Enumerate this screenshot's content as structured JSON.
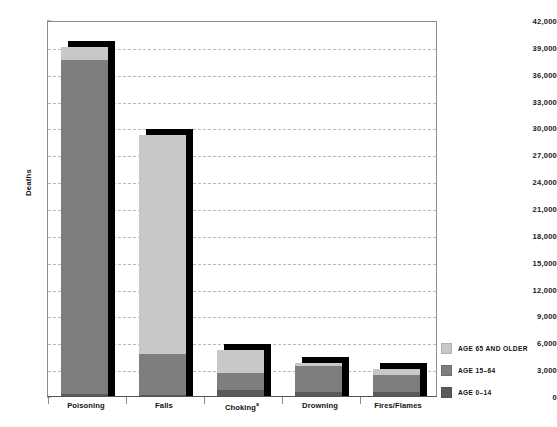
{
  "chart_data": {
    "type": "bar",
    "subtype": "stacked-bar-with-drop-shadow",
    "title": "",
    "xlabel": "",
    "ylabel": "Deaths",
    "ylim": [
      0,
      42000
    ],
    "ytick_step": 3000,
    "ytick_labels": [
      "42,000",
      "39,000",
      "36,000",
      "33,000",
      "30,000",
      "27,000",
      "24,000",
      "21,000",
      "18,000",
      "15,000",
      "12,000",
      "9,000",
      "6,000",
      "3,000",
      "0"
    ],
    "ytick_values": [
      42000,
      39000,
      36000,
      33000,
      30000,
      27000,
      24000,
      21000,
      18000,
      15000,
      12000,
      9000,
      6000,
      3000,
      0
    ],
    "grid": true,
    "grid_style": "dashed-horizontal",
    "legend_position": "right",
    "categories": [
      "Poisoning",
      "Falls",
      "Choking",
      "Drowning",
      "Fires/Flames"
    ],
    "category_labels": [
      "Poisoning",
      "Falls",
      "Chokingᵃ",
      "Drowning",
      "Fires/Flames"
    ],
    "footnote_marker": "a",
    "series": [
      {
        "name": "AGE 65 AND OLDER",
        "color": "#c8c8c8",
        "values": [
          1500,
          24500,
          2500,
          400,
          600
        ]
      },
      {
        "name": "AGE 15–64",
        "color": "#7e7e7e",
        "values": [
          37300,
          4600,
          1900,
          2800,
          1900
        ]
      },
      {
        "name": "AGE 0–14",
        "color": "#5a5a5a",
        "values": [
          200,
          100,
          700,
          500,
          500
        ]
      }
    ],
    "totals": [
      39000,
      29200,
      5100,
      3700,
      3000
    ],
    "shadow_color": "#000000"
  },
  "legend": {
    "items": [
      {
        "label": "AGE 65 AND OLDER",
        "color": "#c8c8c8"
      },
      {
        "label": "AGE 15–64",
        "color": "#7e7e7e"
      },
      {
        "label": "AGE 0–14",
        "color": "#5a5a5a"
      }
    ]
  },
  "axis": {
    "y_title": "Deaths"
  }
}
